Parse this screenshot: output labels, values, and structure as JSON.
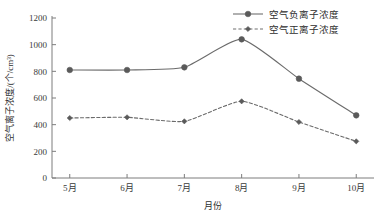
{
  "chart_data": {
    "type": "line",
    "title": "",
    "xlabel": "月份",
    "ylabel": "空气离子浓度/(个/cm³)",
    "categories": [
      "5月",
      "6月",
      "7月",
      "8月",
      "9月",
      "10月"
    ],
    "series": [
      {
        "name": "空气负离子浓度",
        "style": "solid",
        "marker": "circle",
        "color": "#6b6b6b",
        "values": [
          810,
          810,
          830,
          1040,
          745,
          470
        ]
      },
      {
        "name": "空气正离子浓度",
        "style": "dashed",
        "marker": "diamond",
        "color": "#6b6b6b",
        "values": [
          450,
          455,
          425,
          575,
          420,
          275
        ]
      }
    ],
    "ylim": [
      0,
      1200
    ],
    "ytick_values": [
      0,
      200,
      400,
      600,
      800,
      1000,
      1200
    ],
    "ytick_labels": [
      "0",
      "200",
      "400",
      "600",
      "800",
      "1000",
      "1200"
    ],
    "grid": false,
    "legend_position": "top-right"
  },
  "axes": {
    "y_label": "空气离子浓度/(个/cm³)",
    "x_label": "月份"
  },
  "legend": {
    "entries": [
      {
        "label": "空气负离子浓度",
        "dash": "none"
      },
      {
        "label": "空气正离子浓度",
        "dash": "3,2"
      }
    ]
  },
  "colors": {
    "line": "#707070",
    "marker": "#5a5a5a",
    "axis": "#7d7d7d",
    "text": "#2e2e2e"
  }
}
